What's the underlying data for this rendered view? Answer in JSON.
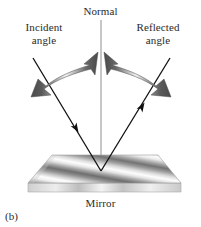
{
  "figure": {
    "caption": "(b)",
    "background_color": "#ffffff",
    "text_color": "#2a2a2a",
    "width": 201,
    "height": 227
  },
  "labels": {
    "normal": "Normal",
    "incident_line1": "Incident",
    "incident_line2": "angle",
    "reflected_line1": "Reflected",
    "reflected_line2": "angle",
    "mirror": "Mirror"
  },
  "diagram": {
    "type": "optics-reflection",
    "normal_line": {
      "x": 101,
      "y_top": 20,
      "y_bottom": 172,
      "color": "#8a8a8a",
      "width": 1
    },
    "incident_ray": {
      "from_x": 33,
      "from_y": 58,
      "to_x": 101,
      "to_y": 171,
      "color": "#1a1a1a",
      "arrowhead_at": 0.66,
      "label": "incident-ray"
    },
    "reflected_ray": {
      "from_x": 101,
      "from_y": 171,
      "to_x": 170,
      "to_y": 58,
      "color": "#1a1a1a",
      "arrowhead_at": 0.62,
      "label": "reflected-ray"
    },
    "incident_angle_arrow": {
      "description": "double-headed curved arrow from normal down-left",
      "gradient_dark": "#4c4c4c",
      "gradient_light": "#f2f2f2"
    },
    "reflected_angle_arrow": {
      "description": "double-headed curved arrow from normal down-right",
      "gradient_dark": "#4c4c4c",
      "gradient_light": "#f2f2f2"
    },
    "mirror_slab": {
      "top_face": [
        [
          28,
          183
        ],
        [
          52,
          155
        ],
        [
          158,
          155
        ],
        [
          181,
          183
        ]
      ],
      "front_face_height": 9,
      "band_dark": "#6e6e6e",
      "band_light": "#fdfdfd",
      "edge_color": "#9a9a9a",
      "front_color": "#d8d8d8"
    }
  }
}
